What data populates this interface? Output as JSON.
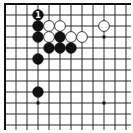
{
  "diagram": {
    "kind": "go-board-corner-diagram",
    "corner_shown": "top-left",
    "visible_cols": 12,
    "visible_rows": 12,
    "edges": {
      "top": true,
      "left": true,
      "right": false,
      "bottom": false
    },
    "colors": {
      "background": "#ffffff",
      "grid_line": "#2b2b2b",
      "edge_line": "#111111",
      "black_stone": "#111111",
      "white_stone_fill": "#ffffff",
      "white_stone_stroke": "#3a3a3a",
      "label_text": "#ffffff"
    },
    "star_points": [
      {
        "col": 10,
        "row": 4
      },
      {
        "col": 4,
        "row": 10
      },
      {
        "col": 10,
        "row": 10
      }
    ],
    "stones": [
      {
        "col": 4,
        "row": 2,
        "color": "black",
        "label": "1"
      },
      {
        "col": 4,
        "row": 3,
        "color": "black"
      },
      {
        "col": 5,
        "row": 3,
        "color": "white"
      },
      {
        "col": 6,
        "row": 3,
        "color": "white"
      },
      {
        "col": 10,
        "row": 3,
        "color": "white"
      },
      {
        "col": 4,
        "row": 4,
        "color": "black"
      },
      {
        "col": 5,
        "row": 4,
        "color": "white"
      },
      {
        "col": 6,
        "row": 4,
        "color": "black"
      },
      {
        "col": 7,
        "row": 4,
        "color": "white"
      },
      {
        "col": 8,
        "row": 4,
        "color": "white"
      },
      {
        "col": 5,
        "row": 5,
        "color": "black"
      },
      {
        "col": 6,
        "row": 5,
        "color": "black"
      },
      {
        "col": 7,
        "row": 5,
        "color": "black"
      },
      {
        "col": 4,
        "row": 6,
        "color": "black"
      },
      {
        "col": 4,
        "row": 9,
        "color": "black"
      }
    ],
    "move_number_shown": "1"
  }
}
